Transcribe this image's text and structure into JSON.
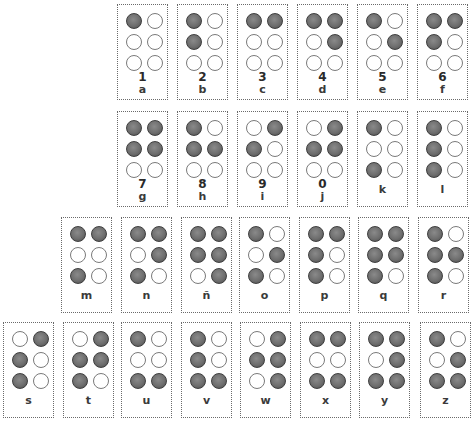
{
  "colors": {
    "dot_filled": "#6e6e6e",
    "dot_empty": "#ffffff",
    "border": "#6a6a6a"
  },
  "cells": [
    {
      "letter": "a",
      "number": "1",
      "dots": [
        1,
        0,
        0,
        0,
        0,
        0
      ],
      "x": 117,
      "y": 4
    },
    {
      "letter": "b",
      "number": "2",
      "dots": [
        1,
        0,
        1,
        0,
        0,
        0
      ],
      "x": 177,
      "y": 4
    },
    {
      "letter": "c",
      "number": "3",
      "dots": [
        1,
        1,
        0,
        0,
        0,
        0
      ],
      "x": 237,
      "y": 4
    },
    {
      "letter": "d",
      "number": "4",
      "dots": [
        1,
        1,
        0,
        1,
        0,
        0
      ],
      "x": 297,
      "y": 4
    },
    {
      "letter": "e",
      "number": "5",
      "dots": [
        1,
        0,
        0,
        1,
        0,
        0
      ],
      "x": 357,
      "y": 4
    },
    {
      "letter": "f",
      "number": "6",
      "dots": [
        1,
        1,
        1,
        0,
        0,
        0
      ],
      "x": 417,
      "y": 4
    },
    {
      "letter": "g",
      "number": "7",
      "dots": [
        1,
        1,
        1,
        1,
        0,
        0
      ],
      "x": 117,
      "y": 111
    },
    {
      "letter": "h",
      "number": "8",
      "dots": [
        1,
        0,
        1,
        1,
        0,
        0
      ],
      "x": 177,
      "y": 111
    },
    {
      "letter": "i",
      "number": "9",
      "dots": [
        0,
        1,
        1,
        0,
        0,
        0
      ],
      "x": 237,
      "y": 111
    },
    {
      "letter": "j",
      "number": "0",
      "dots": [
        0,
        1,
        1,
        1,
        0,
        0
      ],
      "x": 297,
      "y": 111
    },
    {
      "letter": "k",
      "number": "",
      "dots": [
        1,
        0,
        0,
        0,
        1,
        0
      ],
      "x": 357,
      "y": 111
    },
    {
      "letter": "l",
      "number": "",
      "dots": [
        1,
        0,
        1,
        0,
        1,
        0
      ],
      "x": 417,
      "y": 111
    },
    {
      "letter": "m",
      "number": "",
      "dots": [
        1,
        1,
        0,
        0,
        1,
        0
      ],
      "x": 61,
      "y": 217
    },
    {
      "letter": "n",
      "number": "",
      "dots": [
        1,
        1,
        0,
        1,
        1,
        0
      ],
      "x": 121,
      "y": 217
    },
    {
      "letter": "ñ",
      "number": "",
      "dots": [
        1,
        1,
        1,
        1,
        0,
        1
      ],
      "x": 181,
      "y": 217
    },
    {
      "letter": "o",
      "number": "",
      "dots": [
        1,
        0,
        0,
        1,
        1,
        0
      ],
      "x": 239,
      "y": 217
    },
    {
      "letter": "p",
      "number": "",
      "dots": [
        1,
        1,
        1,
        0,
        1,
        0
      ],
      "x": 299,
      "y": 217
    },
    {
      "letter": "q",
      "number": "",
      "dots": [
        1,
        1,
        1,
        1,
        1,
        0
      ],
      "x": 358,
      "y": 217
    },
    {
      "letter": "r",
      "number": "",
      "dots": [
        1,
        0,
        1,
        1,
        1,
        0
      ],
      "x": 418,
      "y": 217
    },
    {
      "letter": "s",
      "number": "",
      "dots": [
        0,
        1,
        1,
        0,
        1,
        0
      ],
      "x": 3,
      "y": 322
    },
    {
      "letter": "t",
      "number": "",
      "dots": [
        0,
        1,
        1,
        1,
        1,
        0
      ],
      "x": 63,
      "y": 322
    },
    {
      "letter": "u",
      "number": "",
      "dots": [
        1,
        0,
        0,
        0,
        1,
        1
      ],
      "x": 121,
      "y": 322
    },
    {
      "letter": "v",
      "number": "",
      "dots": [
        1,
        0,
        1,
        0,
        1,
        1
      ],
      "x": 181,
      "y": 322
    },
    {
      "letter": "w",
      "number": "",
      "dots": [
        0,
        1,
        1,
        1,
        0,
        1
      ],
      "x": 240,
      "y": 322
    },
    {
      "letter": "x",
      "number": "",
      "dots": [
        1,
        1,
        0,
        0,
        1,
        1
      ],
      "x": 300,
      "y": 322
    },
    {
      "letter": "y",
      "number": "",
      "dots": [
        1,
        1,
        0,
        1,
        1,
        1
      ],
      "x": 359,
      "y": 322
    },
    {
      "letter": "z",
      "number": "",
      "dots": [
        1,
        0,
        0,
        1,
        1,
        1
      ],
      "x": 420,
      "y": 322
    }
  ]
}
